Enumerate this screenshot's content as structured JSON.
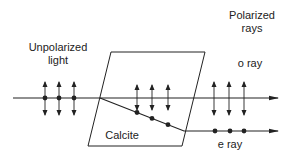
{
  "labels": {
    "unpolarized_line1": "Unpolarized",
    "unpolarized_line2": "light",
    "polarized_line1": "Polarized",
    "polarized_line2": "rays",
    "o_ray": "o ray",
    "e_ray": "e ray",
    "crystal": "Calcite"
  },
  "colors": {
    "stroke": "#222222",
    "background": "#ffffff"
  },
  "rays": {
    "incident": {
      "polarization": "unpolarized",
      "vibration_markers": 3
    },
    "ordinary": {
      "name": "o ray",
      "polarization": "vertical (in-plane)",
      "vibration_markers": 3
    },
    "extraordinary": {
      "name": "e ray",
      "polarization": "perpendicular (dots)",
      "vibration_markers": 3
    }
  }
}
